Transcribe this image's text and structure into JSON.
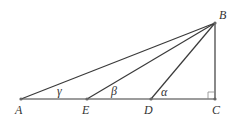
{
  "diagram": {
    "type": "geometry",
    "colors": {
      "line": "#3a3a3a",
      "text": "#333333",
      "background": "#ffffff"
    },
    "points": {
      "A": {
        "label": "A",
        "x": 21,
        "y": 99
      },
      "E": {
        "label": "E",
        "x": 87,
        "y": 99
      },
      "D": {
        "label": "D",
        "x": 151,
        "y": 99
      },
      "C": {
        "label": "C",
        "x": 215,
        "y": 99
      },
      "B": {
        "label": "B",
        "x": 215,
        "y": 23
      }
    },
    "angles": {
      "gamma": {
        "label": "γ",
        "at": "A"
      },
      "beta": {
        "label": "β",
        "at": "E"
      },
      "alpha": {
        "label": "α",
        "at": "D"
      }
    },
    "right_angle_at": "C"
  }
}
